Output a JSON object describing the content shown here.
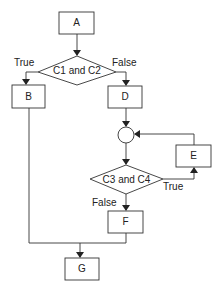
{
  "diagram": {
    "type": "flowchart",
    "nodes": {
      "A": {
        "label": "A",
        "shape": "process"
      },
      "B": {
        "label": "B",
        "shape": "process"
      },
      "D": {
        "label": "D",
        "shape": "process"
      },
      "E": {
        "label": "E",
        "shape": "process"
      },
      "F": {
        "label": "F",
        "shape": "process"
      },
      "G": {
        "label": "G",
        "shape": "process"
      },
      "cond1": {
        "label": "C1 and C2",
        "shape": "decision"
      },
      "cond2": {
        "label": "C3 and C4",
        "shape": "decision"
      },
      "junction": {
        "label": "",
        "shape": "connector"
      }
    },
    "edge_labels": {
      "cond1_true": "True",
      "cond1_false": "False",
      "cond2_true": "True",
      "cond2_false": "False"
    },
    "edges": [
      {
        "from": "A",
        "to": "cond1"
      },
      {
        "from": "cond1",
        "to": "B",
        "label": "True"
      },
      {
        "from": "cond1",
        "to": "D",
        "label": "False"
      },
      {
        "from": "D",
        "to": "junction"
      },
      {
        "from": "junction",
        "to": "cond2"
      },
      {
        "from": "cond2",
        "to": "E",
        "label": "True"
      },
      {
        "from": "E",
        "to": "junction"
      },
      {
        "from": "cond2",
        "to": "F",
        "label": "False"
      },
      {
        "from": "B",
        "to": "G"
      },
      {
        "from": "F",
        "to": "G"
      }
    ],
    "colors": {
      "stroke": "#333333",
      "fill": "#ffffff",
      "text": "#222222"
    }
  }
}
